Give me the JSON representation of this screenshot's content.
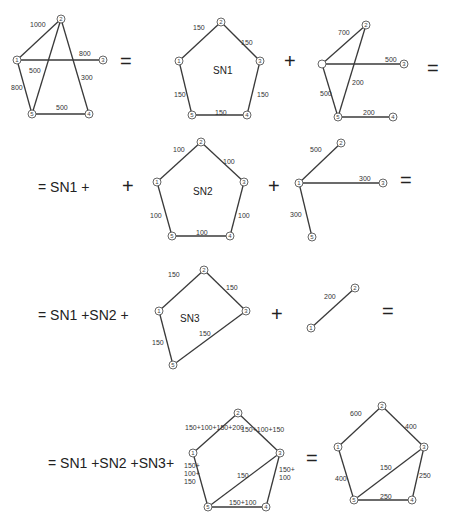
{
  "diagram": {
    "node_radius": 4,
    "graphs": [
      {
        "id": "original",
        "nodes": [
          {
            "id": "1",
            "x": 17,
            "y": 60
          },
          {
            "id": "2",
            "x": 61,
            "y": 19
          },
          {
            "id": "3",
            "x": 103,
            "y": 60
          },
          {
            "id": "4",
            "x": 89,
            "y": 114
          },
          {
            "id": "5",
            "x": 32,
            "y": 114
          }
        ],
        "edges": [
          {
            "from": "1",
            "to": "2",
            "label": "1000",
            "lx": 30,
            "ly": 27
          },
          {
            "from": "1",
            "to": "3",
            "label": "800",
            "lx": 79,
            "ly": 56
          },
          {
            "from": "2",
            "to": "5",
            "label": "500",
            "lx": 29,
            "ly": 73
          },
          {
            "from": "2",
            "to": "4",
            "label": "300",
            "lx": 81,
            "ly": 80
          },
          {
            "from": "1",
            "to": "5",
            "label": "800",
            "lx": 11,
            "ly": 90
          },
          {
            "from": "5",
            "to": "4",
            "label": "500",
            "lx": 56,
            "ly": 110
          }
        ]
      },
      {
        "id": "sn1",
        "center_label": "SN1",
        "center_x": 213,
        "center_y": 74,
        "nodes": [
          {
            "id": "1",
            "x": 179,
            "y": 61
          },
          {
            "id": "2",
            "x": 221,
            "y": 22
          },
          {
            "id": "3",
            "x": 260,
            "y": 61
          },
          {
            "id": "4",
            "x": 247,
            "y": 115
          },
          {
            "id": "5",
            "x": 192,
            "y": 115
          }
        ],
        "edges": [
          {
            "from": "1",
            "to": "2",
            "label": "150",
            "lx": 193,
            "ly": 30
          },
          {
            "from": "2",
            "to": "3",
            "label": "150",
            "lx": 241,
            "ly": 45
          },
          {
            "from": "3",
            "to": "4",
            "label": "150",
            "lx": 257,
            "ly": 97
          },
          {
            "from": "4",
            "to": "5",
            "label": "150",
            "lx": 215,
            "ly": 115
          },
          {
            "from": "5",
            "to": "1",
            "label": "150",
            "lx": 174,
            "ly": 97
          }
        ]
      },
      {
        "id": "rem1",
        "nodes": [
          {
            "id": "1",
            "x": 322,
            "y": 64,
            "unlabeled": true
          },
          {
            "id": "2",
            "x": 366,
            "y": 25
          },
          {
            "id": "3",
            "x": 404,
            "y": 64
          },
          {
            "id": "4",
            "x": 393,
            "y": 117
          },
          {
            "id": "5",
            "x": 338,
            "y": 117
          }
        ],
        "edges": [
          {
            "from": "1",
            "to": "2",
            "label": "700",
            "lx": 338,
            "ly": 35
          },
          {
            "from": "1",
            "to": "3",
            "label": "500",
            "lx": 385,
            "ly": 62
          },
          {
            "from": "2",
            "to": "5",
            "label": "200",
            "lx": 352,
            "ly": 85
          },
          {
            "from": "1",
            "to": "5",
            "label": "500",
            "lx": 320,
            "ly": 96
          },
          {
            "from": "5",
            "to": "4",
            "label": "200",
            "lx": 363,
            "ly": 115
          }
        ]
      },
      {
        "id": "sn2",
        "center_label": "SN2",
        "center_x": 193,
        "center_y": 195,
        "nodes": [
          {
            "id": "1",
            "x": 157,
            "y": 182
          },
          {
            "id": "2",
            "x": 201,
            "y": 142
          },
          {
            "id": "3",
            "x": 244,
            "y": 182
          },
          {
            "id": "4",
            "x": 230,
            "y": 236
          },
          {
            "id": "5",
            "x": 172,
            "y": 236
          }
        ],
        "edges": [
          {
            "from": "1",
            "to": "2",
            "label": "100",
            "lx": 173,
            "ly": 152
          },
          {
            "from": "2",
            "to": "3",
            "label": "100",
            "lx": 223,
            "ly": 164
          },
          {
            "from": "3",
            "to": "4",
            "label": "100",
            "lx": 238,
            "ly": 218
          },
          {
            "from": "4",
            "to": "5",
            "label": "100",
            "lx": 196,
            "ly": 235
          },
          {
            "from": "5",
            "to": "1",
            "label": "100",
            "lx": 150,
            "ly": 218
          }
        ]
      },
      {
        "id": "rem2",
        "nodes": [
          {
            "id": "1",
            "x": 299,
            "y": 183
          },
          {
            "id": "2",
            "x": 341,
            "y": 143
          },
          {
            "id": "3",
            "x": 383,
            "y": 183
          },
          {
            "id": "5",
            "x": 312,
            "y": 237
          }
        ],
        "edges": [
          {
            "from": "1",
            "to": "2",
            "label": "500",
            "lx": 310,
            "ly": 152
          },
          {
            "from": "1",
            "to": "3",
            "label": "300",
            "lx": 359,
            "ly": 181
          },
          {
            "from": "1",
            "to": "5",
            "label": "300",
            "lx": 290,
            "ly": 217
          }
        ]
      },
      {
        "id": "sn3",
        "center_label": "SN3",
        "center_x": 180,
        "center_y": 322,
        "nodes": [
          {
            "id": "1",
            "x": 159,
            "y": 311
          },
          {
            "id": "2",
            "x": 204,
            "y": 270
          },
          {
            "id": "3",
            "x": 246,
            "y": 311
          },
          {
            "id": "5",
            "x": 173,
            "y": 365
          }
        ],
        "edges": [
          {
            "from": "1",
            "to": "2",
            "label": "150",
            "lx": 168,
            "ly": 277
          },
          {
            "from": "2",
            "to": "3",
            "label": "150",
            "lx": 226,
            "ly": 290
          },
          {
            "from": "3",
            "to": "5",
            "label": "150",
            "lx": 199,
            "ly": 336
          },
          {
            "from": "5",
            "to": "1",
            "label": "150",
            "lx": 152,
            "ly": 345
          }
        ]
      },
      {
        "id": "rem3",
        "nodes": [
          {
            "id": "1",
            "x": 311,
            "y": 328
          },
          {
            "id": "2",
            "x": 355,
            "y": 288
          }
        ],
        "edges": [
          {
            "from": "1",
            "to": "2",
            "label": "200",
            "lx": 324,
            "ly": 299
          }
        ]
      },
      {
        "id": "sum",
        "nodes": [
          {
            "id": "1",
            "x": 193,
            "y": 453
          },
          {
            "id": "2",
            "x": 238,
            "y": 413
          },
          {
            "id": "3",
            "x": 280,
            "y": 453
          },
          {
            "id": "4",
            "x": 266,
            "y": 507
          },
          {
            "id": "5",
            "x": 208,
            "y": 507
          }
        ],
        "edges": [
          {
            "from": "1",
            "to": "2",
            "label": "150+100+150+200",
            "lx": 185,
            "ly": 430
          },
          {
            "from": "2",
            "to": "3",
            "label": "150+100+150",
            "lx": 241,
            "ly": 432
          },
          {
            "from": "3",
            "to": "4",
            "label": "150+ 100",
            "lx": 279,
            "ly": 472,
            "multiline": [
              "150+",
              "100"
            ]
          },
          {
            "from": "4",
            "to": "5",
            "label": "150+100",
            "lx": 229,
            "ly": 505
          },
          {
            "from": "5",
            "to": "1",
            "label": "150+ 100+ 150",
            "lx": 184,
            "ly": 468,
            "multiline": [
              "150+",
              "100+",
              "150"
            ]
          },
          {
            "from": "5",
            "to": "3",
            "label": "150",
            "lx": 237,
            "ly": 478
          }
        ]
      },
      {
        "id": "result",
        "nodes": [
          {
            "id": "1",
            "x": 338,
            "y": 447
          },
          {
            "id": "2",
            "x": 382,
            "y": 406
          },
          {
            "id": "3",
            "x": 424,
            "y": 447
          },
          {
            "id": "4",
            "x": 412,
            "y": 500
          },
          {
            "id": "5",
            "x": 354,
            "y": 500
          }
        ],
        "edges": [
          {
            "from": "1",
            "to": "2",
            "label": "600",
            "lx": 350,
            "ly": 416
          },
          {
            "from": "2",
            "to": "3",
            "label": "400",
            "lx": 405,
            "ly": 429
          },
          {
            "from": "3",
            "to": "4",
            "label": "250",
            "lx": 419,
            "ly": 478
          },
          {
            "from": "4",
            "to": "5",
            "label": "250",
            "lx": 380,
            "ly": 499
          },
          {
            "from": "5",
            "to": "1",
            "label": "400",
            "lx": 335,
            "ly": 481
          },
          {
            "from": "5",
            "to": "3",
            "label": "150",
            "lx": 380,
            "ly": 470
          }
        ]
      }
    ],
    "operators": [
      {
        "text": "=",
        "x": 120,
        "y": 68,
        "cls": "op"
      },
      {
        "text": "+",
        "x": 284,
        "y": 68,
        "cls": "op"
      },
      {
        "text": "=",
        "x": 427,
        "y": 75,
        "cls": "op"
      },
      {
        "text": "= SN1 +",
        "x": 38,
        "y": 192,
        "cls": "eq-text"
      },
      {
        "text": "+",
        "x": 122,
        "y": 193,
        "cls": "op"
      },
      {
        "text": "+",
        "x": 268,
        "y": 193,
        "cls": "op"
      },
      {
        "text": "=",
        "x": 400,
        "y": 187,
        "cls": "op"
      },
      {
        "text": "= SN1 +SN2 +",
        "x": 38,
        "y": 320,
        "cls": "eq-text"
      },
      {
        "text": "+",
        "x": 271,
        "y": 321,
        "cls": "op"
      },
      {
        "text": "=",
        "x": 382,
        "y": 318,
        "cls": "op"
      },
      {
        "text": "= SN1 +SN2 +SN3+",
        "x": 48,
        "y": 468,
        "cls": "eq-text"
      },
      {
        "text": "=",
        "x": 306,
        "y": 465,
        "cls": "op"
      }
    ]
  }
}
